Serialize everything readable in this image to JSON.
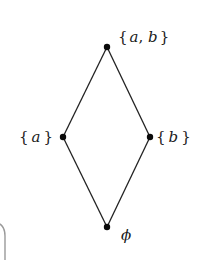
{
  "diagram": {
    "type": "hasse-diagram",
    "colors": {
      "edge": "#222222",
      "node": "#0a0a0a",
      "label": "#1a1a1a",
      "frame": "#9a9a9a"
    },
    "nodes": [
      {
        "id": "ab",
        "label": "{a, b}",
        "x": 107,
        "y": 47
      },
      {
        "id": "a",
        "label": "{a}",
        "x": 63,
        "y": 137
      },
      {
        "id": "b",
        "label": "{b}",
        "x": 150,
        "y": 137
      },
      {
        "id": "empty",
        "label": "ϕ",
        "x": 107,
        "y": 227
      }
    ],
    "edges": [
      {
        "from": "empty",
        "to": "a"
      },
      {
        "from": "empty",
        "to": "b"
      },
      {
        "from": "a",
        "to": "ab"
      },
      {
        "from": "b",
        "to": "ab"
      }
    ],
    "labels": {
      "top": {
        "open": "{",
        "var1": "a",
        "sep": ", ",
        "var2": "b",
        "close": "}"
      },
      "left": {
        "open": "{",
        "var": "a",
        "close": "}"
      },
      "right": {
        "open": "{",
        "var": "b",
        "close": "}"
      },
      "bottom": {
        "symbol": "ϕ"
      }
    }
  }
}
